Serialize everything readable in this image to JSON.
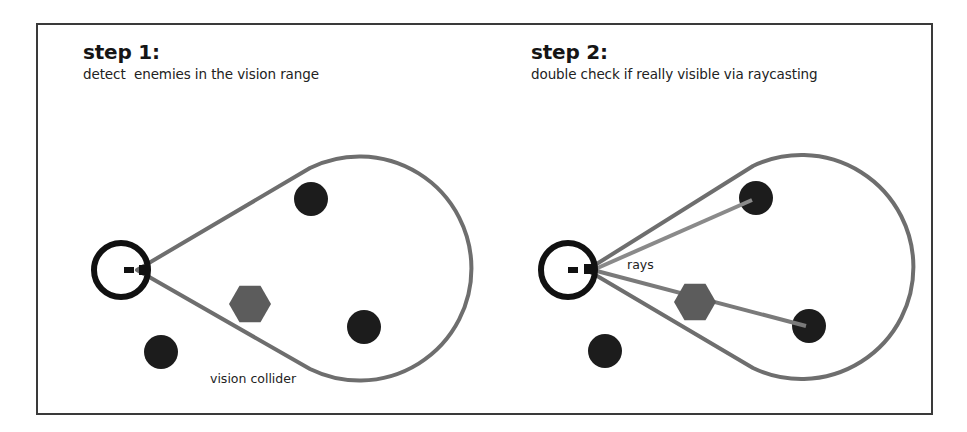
{
  "colors": {
    "frame": "#3a3a3a",
    "player": "#111111",
    "cone": "#6e6e6e",
    "ray": "#8a8a8a",
    "enemy": "#1c1c1c",
    "obstacle": "#5c5c5c"
  },
  "panels": [
    {
      "title": "step 1:",
      "description": "detect  enemies in the vision range",
      "annotation": "vision collider",
      "player": {
        "cx": 121,
        "cy": 270,
        "r": 27
      },
      "cone": {
        "apex": [
          137,
          270
        ],
        "top": [
          310,
          168
        ],
        "bottom": [
          310,
          369
        ],
        "arc_radius": 112
      },
      "enemies": [
        {
          "cx": 311,
          "cy": 199,
          "r": 17
        },
        {
          "cx": 364,
          "cy": 327,
          "r": 17
        },
        {
          "cx": 161,
          "cy": 352,
          "r": 17
        }
      ],
      "obstacle": {
        "cx": 250,
        "cy": 304,
        "r": 21
      },
      "rays": []
    },
    {
      "title": "step 2:",
      "description": "double check if really visible via raycasting",
      "annotation": "rays",
      "player": {
        "cx": 568,
        "cy": 270,
        "r": 27
      },
      "cone": {
        "apex": [
          587,
          270
        ],
        "top": [
          753,
          166
        ],
        "bottom": [
          753,
          368
        ],
        "arc_radius": 112
      },
      "enemies": [
        {
          "cx": 756,
          "cy": 198,
          "r": 17
        },
        {
          "cx": 809,
          "cy": 326,
          "r": 17
        },
        {
          "cx": 605,
          "cy": 351,
          "r": 17
        }
      ],
      "obstacle": {
        "cx": 695,
        "cy": 302,
        "r": 21
      },
      "rays": [
        {
          "from": [
            593,
            270
          ],
          "to": [
            752,
            200
          ]
        },
        {
          "from": [
            593,
            270
          ],
          "to": [
            806,
            326
          ]
        }
      ]
    }
  ]
}
